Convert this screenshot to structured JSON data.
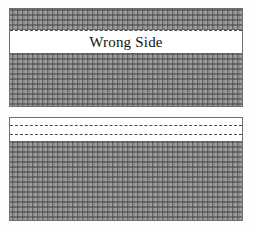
{
  "figure": {
    "background_color": "#ffffff",
    "fabric_color": "#8d8d8d",
    "line_color": "#4a4a4a",
    "text_color": "#111111"
  },
  "panels": [
    {
      "id": "panel-top",
      "name": "top-fabric-panel",
      "label": "Wrong Side",
      "x": 9,
      "y": 8,
      "width": 234,
      "height": 99,
      "white_band": {
        "top": 21,
        "height": 23
      },
      "fold_lines": 1
    },
    {
      "id": "panel-bottom",
      "name": "bottom-fabric-panel",
      "label": "",
      "x": 9,
      "y": 117,
      "width": 234,
      "height": 104,
      "white_band": {
        "top": 0,
        "height": 23
      },
      "fold_lines": 2
    }
  ],
  "labels": {
    "wrong_side": "Wrong Side"
  }
}
